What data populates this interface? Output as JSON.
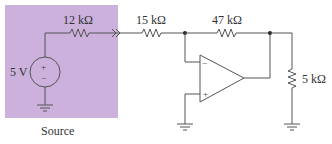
{
  "diagram": {
    "type": "op-amp inverting amplifier circuit",
    "source_box": {
      "label": "Source",
      "fill_color": "#cbb1dc"
    },
    "components": {
      "voltage_source": {
        "label": "5 V",
        "plus": "+",
        "minus": "−"
      },
      "r_source": {
        "label": "12 kΩ"
      },
      "r_input": {
        "label": "15 kΩ"
      },
      "r_feedback": {
        "label": "47 kΩ"
      },
      "r_load": {
        "label": "5 kΩ"
      },
      "opamp": {
        "inverting": "−",
        "noninverting": "+"
      }
    },
    "wire_color": "#555555"
  }
}
